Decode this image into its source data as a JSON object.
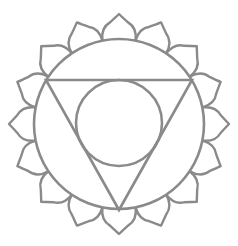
{
  "figure": {
    "stroke_color": "#8a8a8a",
    "background": "#ffffff",
    "outer_circle": {
      "cx": 119,
      "cy": 124,
      "r": 85
    },
    "inner_circle": {
      "cx": 119,
      "cy": 123,
      "r": 43
    },
    "triangle": {
      "points": [
        [
          46,
          80
        ],
        [
          192,
          80
        ],
        [
          119,
          210
        ]
      ]
    },
    "petals": {
      "count": 16,
      "base_radius": 85,
      "tip_radius": 110
    }
  }
}
